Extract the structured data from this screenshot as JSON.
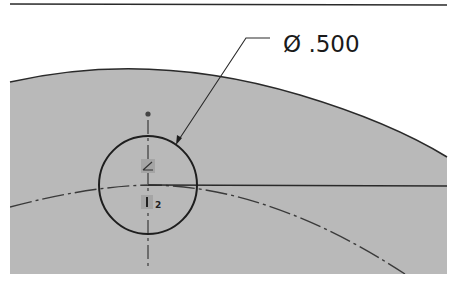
{
  "drawing": {
    "dimension": {
      "symbol": "Ø",
      "value": ".500",
      "label": "Ø .500"
    },
    "relation_glyphs": {
      "coincident_label": "",
      "marker_index": "2"
    },
    "colors": {
      "part_fill": "#b9b9b9",
      "line": "#2a2a2a",
      "background": "#ffffff"
    }
  }
}
